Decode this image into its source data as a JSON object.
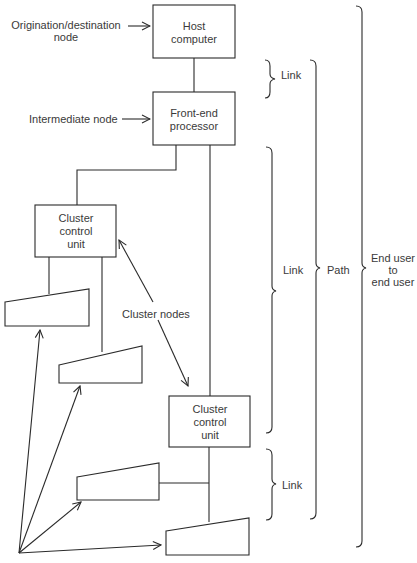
{
  "diagram": {
    "nodes": {
      "host": [
        "Host",
        "computer"
      ],
      "fep": [
        "Front-end",
        "processor"
      ],
      "ccu1": [
        "Cluster",
        "control",
        "unit"
      ],
      "ccu2": [
        "Cluster",
        "control",
        "unit"
      ]
    },
    "labels": {
      "origination": [
        "Origination/destination",
        "node"
      ],
      "intermediate": "Intermediate node",
      "cluster_nodes": "Cluster nodes",
      "link1": "Link",
      "link2": "Link",
      "link3": "Link",
      "path": "Path",
      "end_user": [
        "End user",
        "to",
        "end user"
      ]
    }
  }
}
